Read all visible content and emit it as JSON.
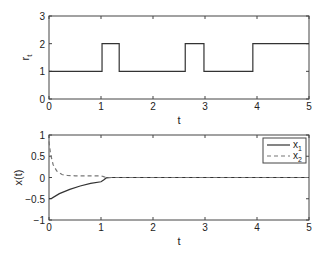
{
  "chart_data": [
    {
      "type": "line",
      "title": "",
      "xlabel": "t",
      "ylabel": "r_t",
      "xlim": [
        0,
        5
      ],
      "ylim": [
        0,
        3
      ],
      "xticks": [
        "0",
        "1",
        "2",
        "3",
        "4",
        "5"
      ],
      "yticks": [
        "0",
        "1",
        "2",
        "3"
      ],
      "grid": false,
      "series": [
        {
          "name": "r_t",
          "style": "solid",
          "step": true,
          "x": [
            0,
            1.02,
            1.02,
            1.35,
            1.35,
            2.62,
            2.62,
            2.98,
            2.98,
            3.92,
            3.92,
            5
          ],
          "y": [
            1,
            1,
            2,
            2,
            1,
            1,
            2,
            2,
            1,
            1,
            2,
            2
          ]
        }
      ]
    },
    {
      "type": "line",
      "title": "",
      "xlabel": "t",
      "ylabel": "x(t)",
      "xlim": [
        0,
        5
      ],
      "ylim": [
        -1,
        1
      ],
      "xticks": [
        "0",
        "1",
        "2",
        "3",
        "4",
        "5"
      ],
      "yticks": [
        "-1",
        "-0.5",
        "0",
        "0.5",
        "1"
      ],
      "grid": false,
      "legend": {
        "position": "upper right",
        "entries": [
          "x_1",
          "x_2"
        ]
      },
      "series": [
        {
          "name": "x_1",
          "style": "solid",
          "x": [
            0,
            0.05,
            0.2,
            0.4,
            0.6,
            0.8,
            1.0,
            1.05,
            1.1,
            1.2,
            5
          ],
          "y": [
            -0.5,
            -0.49,
            -0.38,
            -0.28,
            -0.2,
            -0.14,
            -0.1,
            -0.06,
            -0.01,
            0,
            0
          ]
        },
        {
          "name": "x_2",
          "style": "dashed",
          "x": [
            0,
            0.03,
            0.08,
            0.15,
            0.25,
            0.35,
            0.5,
            1.0,
            1.05,
            1.1,
            5
          ],
          "y": [
            0.85,
            0.55,
            0.3,
            0.15,
            0.07,
            0.05,
            0.04,
            0.04,
            0.02,
            0,
            0
          ]
        }
      ]
    }
  ],
  "labels": {
    "top": {
      "xlabel": "t",
      "ylabel_main": "r",
      "ylabel_sub": "t"
    },
    "bottom": {
      "xlabel": "t",
      "ylabel": "x(t)",
      "legend": [
        {
          "main": "x",
          "sub": "1"
        },
        {
          "main": "x",
          "sub": "2"
        }
      ]
    }
  }
}
